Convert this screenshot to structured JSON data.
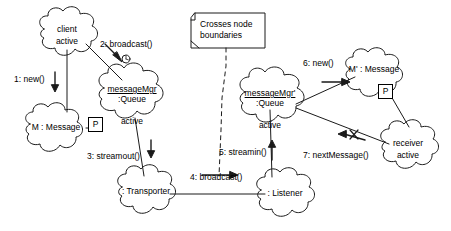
{
  "diagram": {
    "stroke_color": "#000000",
    "background_color": "#ffffff",
    "note": {
      "text": "Crosses node boundaries"
    },
    "nodes": [
      {
        "id": "client",
        "name": "client",
        "state": "active",
        "underlined": false,
        "shape": "cloud"
      },
      {
        "id": "message-m",
        "name": "M : Message",
        "state": "",
        "underlined": false,
        "shape": "cloud",
        "badge": "P"
      },
      {
        "id": "message-mgr",
        "name": "messageMgr",
        "type": ":Queue",
        "state": "active",
        "underlined": true,
        "shape": "cloud"
      },
      {
        "id": "transporter",
        "name": ": Transporter",
        "state": "",
        "underlined": false,
        "shape": "cloud"
      },
      {
        "id": "listener",
        "name": ": Listener",
        "state": "",
        "underlined": false,
        "shape": "cloud"
      },
      {
        "id": "message-mgr-prime",
        "name": "messageMgr'",
        "type": ":Queue",
        "state": "active",
        "underlined": true,
        "shape": "cloud"
      },
      {
        "id": "message-m-prime",
        "name": "M' : Message",
        "state": "",
        "underlined": false,
        "shape": "cloud",
        "badge": "P"
      },
      {
        "id": "receiver",
        "name": "receiver",
        "state": "active",
        "underlined": false,
        "shape": "cloud"
      }
    ],
    "messages": [
      {
        "seq": "1",
        "label": "1: new()",
        "from": "client",
        "to": "message-m",
        "direction": "down"
      },
      {
        "seq": "2",
        "label": "2: broadcast()",
        "from": "client",
        "to": "message-mgr",
        "direction": "down-right",
        "marker": "clock"
      },
      {
        "seq": "3",
        "label": "3: streamout()",
        "from": "message-mgr",
        "to": "transporter",
        "direction": "down"
      },
      {
        "seq": "4",
        "label": "4: broadcast()",
        "from": "transporter",
        "to": "listener",
        "direction": "right"
      },
      {
        "seq": "5",
        "label": "5: streamin()",
        "from": "listener",
        "to": "message-mgr-prime",
        "direction": "up"
      },
      {
        "seq": "6",
        "label": "6: new()",
        "from": "message-mgr-prime",
        "to": "message-m-prime",
        "direction": "right"
      },
      {
        "seq": "7",
        "label": "7: nextMessage()",
        "from": "receiver",
        "to": "message-mgr-prime",
        "direction": "left",
        "marker": "x"
      }
    ]
  }
}
